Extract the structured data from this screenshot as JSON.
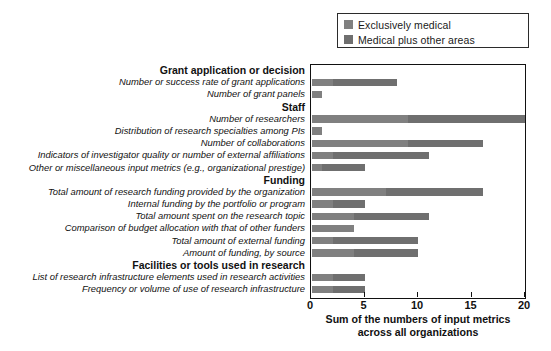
{
  "legend": {
    "items": [
      {
        "label": "Exclusively medical",
        "color": "#808080"
      },
      {
        "label": "Medical plus other areas",
        "color": "#6f6f6f"
      }
    ]
  },
  "axis": {
    "ticks": [
      "0",
      "5",
      "10",
      "15",
      "20"
    ],
    "title_line1": "Sum of the numbers of input metrics",
    "title_line2": "across all organizations"
  },
  "chart_data": {
    "type": "bar",
    "orientation": "horizontal",
    "title": "",
    "xlabel": "Sum of the numbers of input metrics across all organizations",
    "ylabel": "",
    "xlim": [
      0,
      20
    ],
    "xticks": [
      0,
      5,
      10,
      15,
      20
    ],
    "grid": false,
    "legend_position": "top-right",
    "stacked": true,
    "series": [
      {
        "name": "Exclusively medical",
        "color": "#808080"
      },
      {
        "name": "Medical plus other areas",
        "color": "#6f6f6f"
      }
    ],
    "groups": [
      {
        "category": "Grant application or decision",
        "rows": [
          {
            "label": "Number or success rate of grant applications",
            "exclusively_medical": 2,
            "medical_plus_other": 6,
            "total": 8
          },
          {
            "label": "Number of grant panels",
            "exclusively_medical": 1,
            "medical_plus_other": 0,
            "total": 1
          }
        ]
      },
      {
        "category": "Staff",
        "rows": [
          {
            "label": "Number of researchers",
            "exclusively_medical": 9,
            "medical_plus_other": 11,
            "total": 20
          },
          {
            "label": "Distribution of research specialties among PIs",
            "exclusively_medical": 1,
            "medical_plus_other": 0,
            "total": 1
          },
          {
            "label": "Number of collaborations",
            "exclusively_medical": 9,
            "medical_plus_other": 7,
            "total": 16
          },
          {
            "label": "Indicators of investigator quality or number of external affiliations",
            "exclusively_medical": 2,
            "medical_plus_other": 9,
            "total": 11
          },
          {
            "label": "Other or miscellaneous input metrics (e.g., organizational prestige)",
            "exclusively_medical": 1,
            "medical_plus_other": 4,
            "total": 5
          }
        ]
      },
      {
        "category": "Funding",
        "rows": [
          {
            "label": "Total amount of research funding provided by the organization",
            "exclusively_medical": 7,
            "medical_plus_other": 9,
            "total": 16
          },
          {
            "label": "Internal funding by the portfolio or program",
            "exclusively_medical": 2,
            "medical_plus_other": 3,
            "total": 5
          },
          {
            "label": "Total amount spent on the research topic",
            "exclusively_medical": 4,
            "medical_plus_other": 7,
            "total": 11
          },
          {
            "label": "Comparison of budget allocation with that of other funders",
            "exclusively_medical": 4,
            "medical_plus_other": 0,
            "total": 4
          },
          {
            "label": "Total amount of external funding",
            "exclusively_medical": 2,
            "medical_plus_other": 8,
            "total": 10
          },
          {
            "label": "Amount of funding, by source",
            "exclusively_medical": 4,
            "medical_plus_other": 6,
            "total": 10
          }
        ]
      },
      {
        "category": "Facilities or tools used in research",
        "rows": [
          {
            "label": "List of research infrastructure elements used in research activities",
            "exclusively_medical": 2,
            "medical_plus_other": 3,
            "total": 5
          },
          {
            "label": "Frequency or volume of use of research infrastructure",
            "exclusively_medical": 2,
            "medical_plus_other": 3,
            "total": 5
          }
        ]
      }
    ]
  }
}
